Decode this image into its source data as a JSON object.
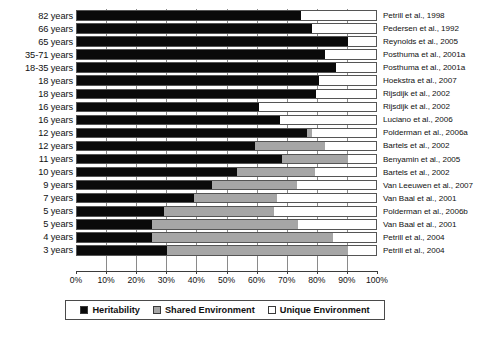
{
  "chart_data": {
    "type": "bar",
    "subtype": "horizontal-stacked-100",
    "title": "",
    "xlabel": "",
    "ylabel": "",
    "xlim": [
      0,
      100
    ],
    "xticks": [
      0,
      10,
      20,
      30,
      40,
      50,
      60,
      70,
      80,
      90,
      100
    ],
    "xticklabels": [
      "0%",
      "10%",
      "20%",
      "30%",
      "40%",
      "50%",
      "60%",
      "70%",
      "80%",
      "90%",
      "100%"
    ],
    "grid": true,
    "legend_position": "bottom",
    "categories": [
      "82 years",
      "66 years",
      "65 years",
      "35-71 years",
      "18-35 years",
      "18 years",
      "18 years",
      "16 years",
      "16 years",
      "12 years",
      "12 years",
      "11 years",
      "10 years",
      "9 years",
      "7 years",
      "5 years",
      "5 years",
      "4 years",
      "3 years"
    ],
    "source_labels": [
      "Petrill et al., 1998",
      "Pedersen et al., 1992",
      "Reynolds et al., 2005",
      "Posthuma et al., 2001a",
      "Posthuma et al., 2001a",
      "Hoekstra et al., 2007",
      "Rijsdijk et al., 2002",
      "Rijsdijk et al., 2002",
      "Luciano et al., 2006",
      "Polderman et al., 2006a",
      "Bartels et al., 2002",
      "Benyamin et al., 2005",
      "Bartels et al., 2002",
      "Van Leeuwen et al., 2007",
      "Van Baal et al., 2001",
      "Polderman et al., 2006b",
      "Van Baal et al., 2001",
      "Petrill et al., 2004",
      "Petrill et al., 2004"
    ],
    "series": [
      {
        "name": "Heritability",
        "color": "#0a0a0a",
        "values": [
          74.5,
          78,
          90,
          82.5,
          86,
          80.5,
          79.5,
          60.5,
          67.5,
          76.5,
          59,
          68,
          53,
          45,
          39,
          29,
          25,
          25,
          30
        ]
      },
      {
        "name": "Shared Environment",
        "color": "#a6a6a6",
        "values": [
          0,
          0,
          0,
          0,
          0,
          0,
          0,
          0,
          0,
          1.5,
          23.5,
          22,
          26,
          28,
          27.5,
          36.5,
          48.5,
          60,
          60
        ]
      },
      {
        "name": "Unique Environment",
        "color": "#ffffff",
        "values": [
          25.5,
          22,
          10,
          17.5,
          14,
          19.5,
          20.5,
          39.5,
          32.5,
          22,
          17.5,
          10,
          21,
          27,
          33.5,
          34.5,
          26.5,
          15,
          10
        ]
      }
    ]
  },
  "legend": {
    "items": [
      {
        "label": "Heritability",
        "swatch": "black-square-swatch"
      },
      {
        "label": "Shared Environment",
        "swatch": "gray-square-swatch"
      },
      {
        "label": "Unique Environment",
        "swatch": "white-square-swatch"
      }
    ]
  }
}
